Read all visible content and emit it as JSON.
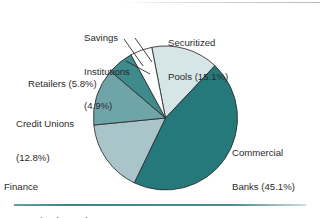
{
  "figure": {
    "background_color": "#ffffff",
    "rule_color": "#3d8589",
    "top_rule_color": "#b9b9b9"
  },
  "chart_data": {
    "type": "pie",
    "title": "",
    "subtitle": "",
    "xlabel": "",
    "ylabel": "",
    "legend_position": "none",
    "grid": false,
    "units": "percent",
    "start_angle_deg": -11,
    "direction": "clockwise",
    "categories": [
      "Securitized Pools",
      "Commercial Banks",
      "Finance Companies",
      "Credit Unions",
      "Retailers",
      "Savings Institutions"
    ],
    "values": [
      15.1,
      45.1,
      16.3,
      12.8,
      5.8,
      4.9
    ],
    "value_labels": [
      "15.1%",
      "45.1%",
      "16.3%",
      "12.8%",
      "5.8%",
      "4.9%"
    ],
    "colors": [
      "#d6e6e6",
      "#25797b",
      "#a9c5ca",
      "#6fa4a9",
      "#3e8a8c",
      "#ffffff"
    ],
    "slices": [
      {
        "name": "Securitized Pools",
        "value": 15.1,
        "color": "#d6e6e6",
        "label": "Securitized\nPools (15.1%)"
      },
      {
        "name": "Commercial Banks",
        "value": 45.1,
        "color": "#25797b",
        "label": "Commercial\nBanks (45.1%)"
      },
      {
        "name": "Finance Companies",
        "value": 16.3,
        "color": "#a9c5ca",
        "label": "Finance\nCompanies (16.3%)"
      },
      {
        "name": "Credit Unions",
        "value": 12.8,
        "color": "#6fa4a9",
        "label": "Credit Unions\n(12.8%)"
      },
      {
        "name": "Retailers",
        "value": 5.8,
        "color": "#3e8a8c",
        "label": "Retailers (5.8%)"
      },
      {
        "name": "Savings Institutions",
        "value": 4.9,
        "color": "#ffffff",
        "label": "Savings\nInstitutions\n(4.9%)"
      }
    ]
  },
  "labels": {
    "savings_line1": "Savings",
    "savings_line2": "Institutions",
    "savings_line3": "(4.9%)",
    "securitized_line1": "Securitized",
    "securitized_line2": "Pools (15.1%)",
    "retailers_line1": "Retailers (5.8%)",
    "credit_line1": "Credit Unions",
    "credit_line2": "(12.8%)",
    "finance_line1": "Finance",
    "finance_line2": "Companies (16.3%)",
    "commercial_line1": "Commercial",
    "commercial_line2": "Banks (45.1%)"
  }
}
